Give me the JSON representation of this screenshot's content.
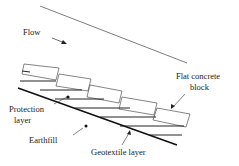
{
  "diagram": {
    "labels": {
      "flow": "Flow",
      "flat_concrete_block_line1": "Flat concrete",
      "flat_concrete_block_line2": "block",
      "protection_layer_line1": "Protection",
      "protection_layer_line2": "layer",
      "earthfill": "Earthfill",
      "geotextile_layer": "Geotextile layer"
    },
    "colors": {
      "line": "#222222",
      "background": "#ffffff"
    }
  }
}
